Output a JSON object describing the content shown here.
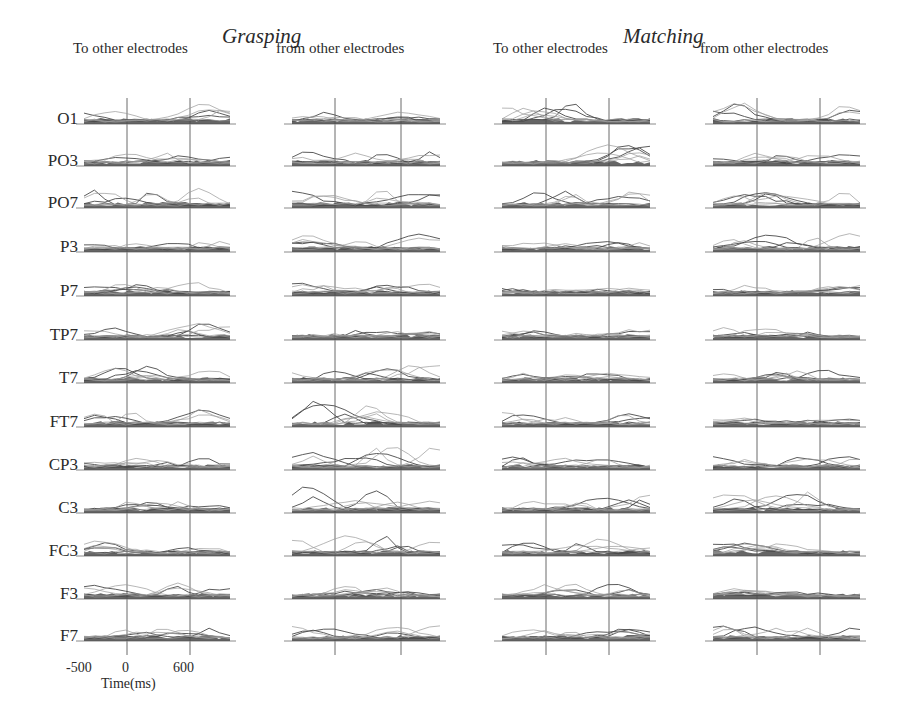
{
  "chart_data": {
    "type": "line",
    "title": "",
    "groups": [
      {
        "name": "Grasping",
        "columns": [
          "To other electrodes",
          "from other electrodes"
        ]
      },
      {
        "name": "Matching",
        "columns": [
          "To other electrodes",
          "from other electrodes"
        ]
      }
    ],
    "electrodes": [
      "O1",
      "PO3",
      "PO7",
      "P3",
      "P7",
      "TP7",
      "T7",
      "FT7",
      "CP3",
      "C3",
      "FC3",
      "F3",
      "F7"
    ],
    "xlabel": "Time(ms)",
    "ylabel": "",
    "x_ticks": [
      -500,
      0,
      600
    ],
    "xlim": [
      -500,
      1200
    ],
    "vertical_reference_lines_at": [
      0,
      600
    ],
    "grid": false,
    "legend": null,
    "note": "Small-multiple EEG connectivity traces (many overlaid gray lines per panel); per-panel shapes approximated",
    "panels_peak_activity": {
      "Grasping_to": {
        "O1": 0.7,
        "PO3": 0.4,
        "PO7": 0.7,
        "P3": 0.3,
        "P7": 0.5,
        "TP7": 0.6,
        "T7": 0.6,
        "FT7": 0.8,
        "CP3": 0.4,
        "C3": 0.4,
        "FC3": 0.5,
        "F3": 0.6,
        "F7": 0.5
      },
      "Grasping_from": {
        "O1": 0.4,
        "PO3": 0.5,
        "PO7": 0.7,
        "P3": 0.7,
        "P7": 0.4,
        "TP7": 0.3,
        "T7": 0.8,
        "FT7": 1.0,
        "CP3": 0.9,
        "C3": 1.0,
        "FC3": 0.8,
        "F3": 0.5,
        "F7": 0.6
      },
      "Matching_to": {
        "O1": 0.8,
        "PO3": 0.8,
        "PO7": 0.6,
        "P3": 0.3,
        "P7": 0.2,
        "TP7": 0.3,
        "T7": 0.3,
        "FT7": 0.5,
        "CP3": 0.4,
        "C3": 0.6,
        "FC3": 0.6,
        "F3": 0.5,
        "F7": 0.6
      },
      "Matching_from": {
        "O1": 0.9,
        "PO3": 0.4,
        "PO7": 0.8,
        "P3": 0.8,
        "P7": 0.3,
        "TP7": 0.4,
        "T7": 0.4,
        "FT7": 0.3,
        "CP3": 0.6,
        "C3": 0.8,
        "FC3": 0.5,
        "F3": 0.3,
        "F7": 0.6
      }
    }
  },
  "header": {
    "grasping": "Grasping",
    "matching": "Matching",
    "col1": "To other electrodes",
    "col2": "from other electrodes",
    "col3": "To other electrodes",
    "col4": "from other electrodes"
  },
  "rows": [
    "O1",
    "PO3",
    "PO7",
    "P3",
    "P7",
    "TP7",
    "T7",
    "FT7",
    "CP3",
    "C3",
    "FC3",
    "F3",
    "F7"
  ],
  "axis": {
    "tick_neg500": "-500",
    "tick_0": "0",
    "tick_600": "600",
    "xlabel": "Time(ms)"
  },
  "colors": {
    "trace_dark": "#4a4a4a",
    "trace_light": "#9a9a9a",
    "baseline": "#8a8a8a",
    "refline": "#6a6a6a"
  }
}
